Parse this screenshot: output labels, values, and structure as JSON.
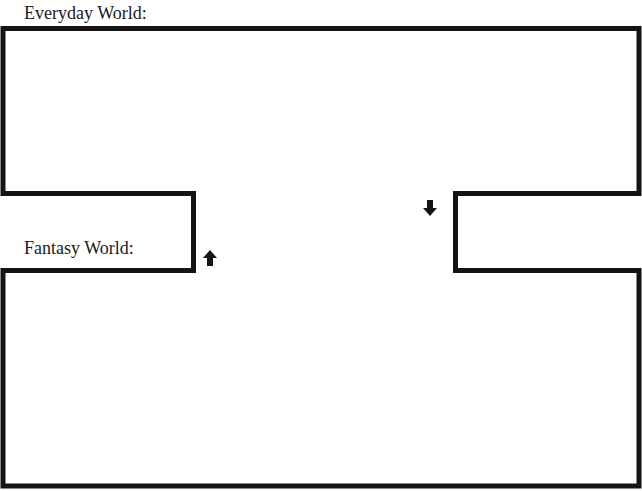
{
  "worksheet": {
    "cutoff_heading": "",
    "sections": {
      "everyday": {
        "label": "Everyday World:"
      },
      "fantasy": {
        "label": "Fantasy World:"
      }
    },
    "arrows": {
      "down": {
        "direction": "down",
        "icon": "arrow-down-icon"
      },
      "up": {
        "direction": "up",
        "icon": "arrow-up-icon"
      }
    },
    "colors": {
      "border": "#141414",
      "background": "#ffffff",
      "text": "#1a1a1a"
    }
  }
}
